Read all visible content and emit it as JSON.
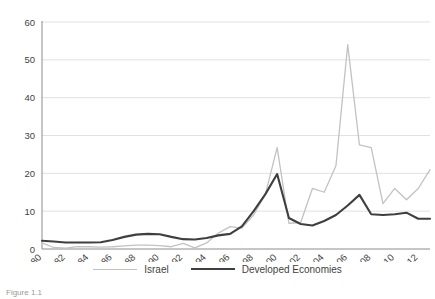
{
  "chart_data": {
    "type": "line",
    "title": "",
    "xlabel": "",
    "ylabel": "",
    "ylim": [
      0,
      60
    ],
    "yticks": [
      0,
      10,
      20,
      30,
      40,
      50,
      60
    ],
    "xlim": [
      1980,
      2013
    ],
    "xticks": [
      1980,
      1982,
      1984,
      1986,
      1988,
      1990,
      1992,
      1994,
      1996,
      1998,
      2000,
      2002,
      2004,
      2006,
      2008,
      2010,
      2012
    ],
    "grid": "horizontal",
    "legend_position": "bottom",
    "x": [
      1980,
      1981,
      1982,
      1983,
      1984,
      1985,
      1986,
      1987,
      1988,
      1989,
      1990,
      1991,
      1992,
      1993,
      1994,
      1995,
      1996,
      1997,
      1998,
      1999,
      2000,
      2001,
      2002,
      2003,
      2004,
      2005,
      2006,
      2007,
      2008,
      2009,
      2010,
      2011,
      2012,
      2013
    ],
    "series": [
      {
        "name": "Israel",
        "color": "#c2c2c2",
        "values": [
          1.6,
          0.4,
          0.2,
          0.6,
          0.6,
          0.5,
          0.6,
          0.8,
          1.0,
          1.0,
          0.9,
          0.6,
          1.5,
          0.3,
          1.6,
          4.2,
          5.9,
          5.5,
          9.0,
          14.5,
          26.8,
          6.8,
          7.0,
          16.0,
          15.0,
          22.0,
          54.0,
          27.5,
          26.8,
          12.0,
          16.0,
          13.0,
          16.0,
          21.0
        ]
      },
      {
        "name": "Developed Economies",
        "color": "#3f3f3f",
        "values": [
          2.2,
          2.0,
          1.7,
          1.7,
          1.7,
          1.8,
          2.4,
          3.2,
          3.8,
          4.0,
          3.9,
          3.2,
          2.6,
          2.5,
          2.9,
          3.6,
          4.0,
          6.0,
          10.0,
          14.5,
          19.8,
          8.2,
          6.6,
          6.2,
          7.4,
          9.0,
          11.5,
          14.3,
          9.2,
          9.0,
          9.2,
          9.6,
          8.0,
          8.0
        ]
      }
    ]
  },
  "legend": {
    "items": [
      {
        "label": "Israel"
      },
      {
        "label": "Developed Economies"
      }
    ]
  },
  "caption": {
    "text": "Figure 1.1"
  }
}
